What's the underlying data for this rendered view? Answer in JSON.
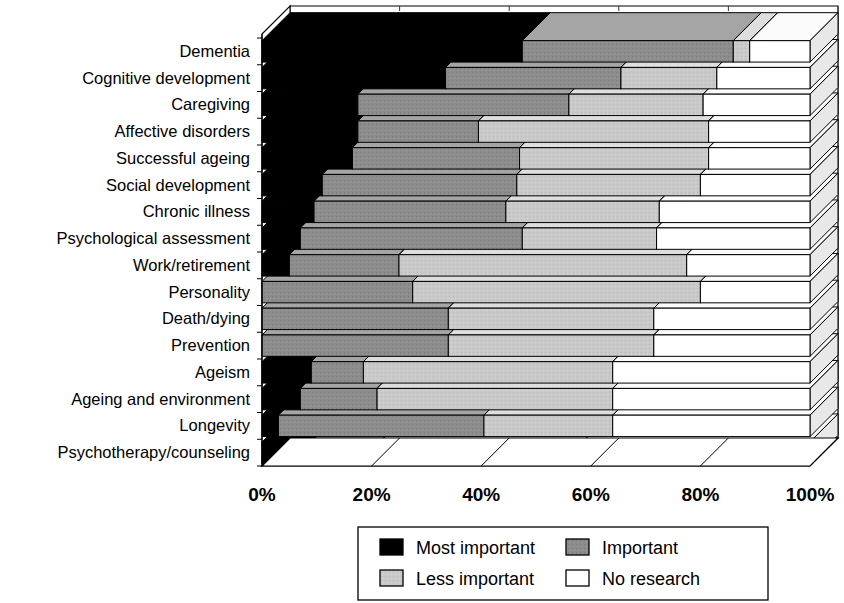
{
  "chart_data": {
    "type": "bar",
    "orientation": "horizontal",
    "stacked": true,
    "stacked_percent": true,
    "three_d": true,
    "title": "",
    "xlabel": "",
    "ylabel": "",
    "xlim": [
      0,
      100
    ],
    "xticks": [
      "0%",
      "20%",
      "40%",
      "60%",
      "80%",
      "100%"
    ],
    "xtick_values": [
      0,
      20,
      40,
      60,
      80,
      100
    ],
    "grid": true,
    "legend_position": "bottom",
    "categories": [
      "Dementia",
      "Cognitive development",
      "Caregiving",
      "Affective disorders",
      "Successful ageing",
      "Social development",
      "Chronic illness",
      "Psychological assessment",
      "Work/retirement",
      "Personality",
      "Death/dying",
      "Prevention",
      "Ageism",
      "Ageing and environment",
      "Longevity",
      "Psychotherapy/counseling"
    ],
    "series": [
      {
        "name": "Most important",
        "color": "#000000",
        "values": [
          47.5,
          33.5,
          17.5,
          17.5,
          16.5,
          11.0,
          9.5,
          7.0,
          5.0,
          0.0,
          0.0,
          0.0,
          9.0,
          7.0,
          3.0,
          9.0
        ]
      },
      {
        "name": "Important",
        "color": "#8c8c8c",
        "values": [
          38.5,
          32.0,
          38.5,
          22.0,
          30.5,
          35.5,
          35.0,
          40.5,
          20.0,
          27.5,
          34.0,
          34.0,
          9.5,
          14.0,
          37.5,
          12.5
        ]
      },
      {
        "name": "Less important",
        "color": "#c9c9c9",
        "values": [
          3.0,
          17.5,
          24.5,
          42.0,
          34.5,
          33.5,
          28.0,
          24.5,
          52.5,
          52.5,
          37.5,
          37.5,
          45.5,
          43.0,
          23.5,
          37.0
        ]
      },
      {
        "name": "No research",
        "color": "#ffffff",
        "values": [
          11.0,
          17.0,
          19.5,
          18.5,
          18.5,
          20.0,
          27.5,
          28.0,
          22.5,
          20.0,
          28.5,
          28.5,
          36.0,
          36.0,
          36.0,
          41.5
        ]
      }
    ]
  },
  "legend": {
    "items": [
      {
        "label": "Most important",
        "swatch": "#000000"
      },
      {
        "label": "Important",
        "swatch": "#8c8c8c"
      },
      {
        "label": "Less important",
        "swatch": "#c9c9c9"
      },
      {
        "label": "No research",
        "swatch": "#ffffff"
      }
    ]
  }
}
